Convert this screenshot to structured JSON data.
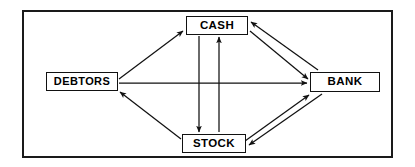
{
  "diagram": {
    "frame": {
      "border_color": "#1a1a1a",
      "background": "#ffffff"
    },
    "nodes": [
      {
        "id": "cash",
        "label": "CASH",
        "position": "top-center"
      },
      {
        "id": "debtors",
        "label": "DEBTORS",
        "position": "middle-left"
      },
      {
        "id": "bank",
        "label": "BANK",
        "position": "middle-right"
      },
      {
        "id": "stock",
        "label": "STOCK",
        "position": "bottom-center"
      }
    ],
    "edges": [
      {
        "id": "debtors-to-cash",
        "from": "DEBTORS",
        "to": "CASH",
        "direction": "one-way"
      },
      {
        "id": "debtors-to-bank",
        "from": "DEBTORS",
        "to": "BANK",
        "direction": "one-way"
      },
      {
        "id": "stock-to-debtors",
        "from": "STOCK",
        "to": "DEBTORS",
        "direction": "one-way"
      },
      {
        "id": "cash-to-bank",
        "from": "CASH",
        "to": "BANK",
        "direction": "one-way"
      },
      {
        "id": "bank-to-cash",
        "from": "BANK",
        "to": "CASH",
        "direction": "one-way"
      },
      {
        "id": "cash-to-stock",
        "from": "CASH",
        "to": "STOCK",
        "direction": "one-way"
      },
      {
        "id": "stock-to-cash",
        "from": "STOCK",
        "to": "CASH",
        "direction": "one-way"
      },
      {
        "id": "stock-to-bank",
        "from": "STOCK",
        "to": "BANK",
        "direction": "one-way"
      },
      {
        "id": "bank-to-stock",
        "from": "BANK",
        "to": "STOCK",
        "direction": "one-way"
      }
    ],
    "colors": {
      "line": "#111111",
      "node_border": "#111111",
      "node_fill": "#ffffff",
      "text": "#000000"
    }
  }
}
